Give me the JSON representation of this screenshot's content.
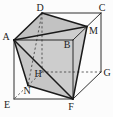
{
  "figure": {
    "width": 113,
    "height": 117,
    "background_color": "#fcfcfc",
    "line_color": "#1a1a1a",
    "dash_color": "#3a3a3a",
    "label_color": "#222222",
    "vertices": {
      "A": [
        14,
        40
      ],
      "B": [
        73,
        40
      ],
      "C": [
        101,
        13
      ],
      "D": [
        42,
        13
      ],
      "E": [
        14,
        99
      ],
      "F": [
        73,
        99
      ],
      "G": [
        101,
        72
      ],
      "H": [
        42,
        72
      ],
      "M": [
        87,
        26.5
      ],
      "N": [
        28,
        85.5
      ]
    },
    "shaded_faces": [
      {
        "name": "face-ADM",
        "points": [
          "A",
          "D",
          "M"
        ],
        "fill": "#c2c2c2"
      },
      {
        "name": "face-AMF",
        "points": [
          "A",
          "M",
          "F"
        ],
        "fill": "#cdcdcd"
      },
      {
        "name": "face-ANF",
        "points": [
          "A",
          "N",
          "F"
        ],
        "fill": "#c6c6c6"
      }
    ],
    "dashed_edges": [
      {
        "name": "edge-DH",
        "from": "D",
        "to": "H"
      },
      {
        "name": "edge-HG",
        "from": "H",
        "to": "G"
      },
      {
        "name": "edge-HE",
        "from": "H",
        "to": "E"
      },
      {
        "name": "edge-DN",
        "from": "D",
        "to": "N"
      }
    ],
    "cube_edges": [
      {
        "name": "edge-DC",
        "from": "D",
        "to": "C"
      },
      {
        "name": "edge-CG",
        "from": "C",
        "to": "G"
      },
      {
        "name": "edge-GF",
        "from": "G",
        "to": "F"
      },
      {
        "name": "edge-FE",
        "from": "F",
        "to": "E"
      },
      {
        "name": "edge-EA",
        "from": "E",
        "to": "A"
      },
      {
        "name": "edge-AB",
        "from": "A",
        "to": "B"
      },
      {
        "name": "edge-BC",
        "from": "B",
        "to": "C"
      },
      {
        "name": "edge-BF",
        "from": "B",
        "to": "F"
      }
    ],
    "solid_edges": [
      {
        "name": "edge-AD",
        "from": "A",
        "to": "D"
      },
      {
        "name": "edge-DM",
        "from": "D",
        "to": "M"
      },
      {
        "name": "edge-MF",
        "from": "M",
        "to": "F"
      },
      {
        "name": "edge-FN",
        "from": "F",
        "to": "N"
      },
      {
        "name": "edge-NA",
        "from": "N",
        "to": "A"
      },
      {
        "name": "edge-AM",
        "from": "A",
        "to": "M"
      },
      {
        "name": "edge-AF",
        "from": "A",
        "to": "F"
      }
    ],
    "labels": [
      {
        "text": "A",
        "x": 6,
        "y": 40
      },
      {
        "text": "B",
        "x": 67,
        "y": 47.5
      },
      {
        "text": "C",
        "x": 102,
        "y": 10.5
      },
      {
        "text": "D",
        "x": 40,
        "y": 10.5
      },
      {
        "text": "E",
        "x": 7,
        "y": 107.5
      },
      {
        "text": "F",
        "x": 71,
        "y": 109.5
      },
      {
        "text": "G",
        "x": 107,
        "y": 75.5
      },
      {
        "text": "H",
        "x": 38,
        "y": 76.5
      },
      {
        "text": "M",
        "x": 93.5,
        "y": 34
      },
      {
        "text": "N",
        "x": 27,
        "y": 93.5
      }
    ],
    "style": {
      "cube_stroke_width": 0.9,
      "solid_stroke_width": 1.5,
      "dash_stroke_width": 0.8,
      "dash_pattern": "2.2,2.2",
      "label_font_size": 10
    }
  }
}
